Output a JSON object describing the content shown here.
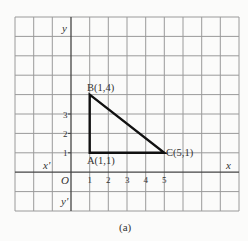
{
  "figure": {
    "caption": "(a)",
    "axes": {
      "x_label": "x",
      "x_neg_label": "x'",
      "y_label": "y",
      "y_neg_label": "y'",
      "origin_label": "O",
      "x_ticks": [
        "1",
        "2",
        "3",
        "4",
        "5"
      ],
      "y_ticks": [
        "1",
        "2",
        "3"
      ]
    },
    "points": [
      {
        "name": "A",
        "label": "A(1,1)",
        "x": 1,
        "y": 1
      },
      {
        "name": "B",
        "label": "B(1,4)",
        "x": 1,
        "y": 4
      },
      {
        "name": "C",
        "label": "C(5,1)",
        "x": 5,
        "y": 1
      }
    ],
    "shape": "right triangle ABC",
    "colors": {
      "grid": "#9a9a9a",
      "axis": "#444444",
      "triangle": "#111111",
      "background": "#fbfbfa"
    }
  }
}
